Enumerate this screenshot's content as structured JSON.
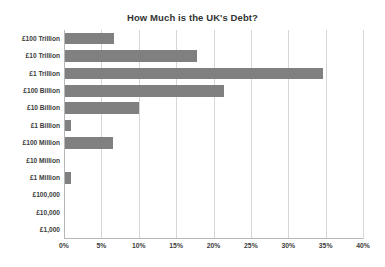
{
  "chart_data": {
    "type": "bar",
    "orientation": "horizontal",
    "title": "How Much is the UK's Debt?",
    "xlabel": "",
    "ylabel": "",
    "categories": [
      "£100 Trillion",
      "£10 Trillion",
      "£1 Trillion",
      "£100 Billion",
      "£10 Billion",
      "£1 Billion",
      "£100 Million",
      "£10 Million",
      "£1 Million",
      "£100,000",
      "£10,000",
      "£1,000"
    ],
    "values": [
      6.7,
      17.8,
      34.7,
      21.4,
      10.0,
      1.0,
      6.6,
      0,
      1.0,
      0,
      0,
      0
    ],
    "value_suffix": "%",
    "xlim": [
      0,
      40
    ],
    "xticks": [
      0,
      5,
      10,
      15,
      20,
      25,
      30,
      35,
      40
    ],
    "xtick_labels": [
      "0%",
      "5%",
      "10%",
      "15%",
      "20%",
      "25%",
      "30%",
      "35%",
      "40%"
    ],
    "grid": true,
    "grid_axis": "x",
    "legend": false,
    "bar_color": "#808080",
    "grid_color": "#d6d6d6",
    "axis_color": "#b7b7b7",
    "title_color": "#333333",
    "label_color": "#3c3c3c",
    "background": "#ffffff"
  }
}
